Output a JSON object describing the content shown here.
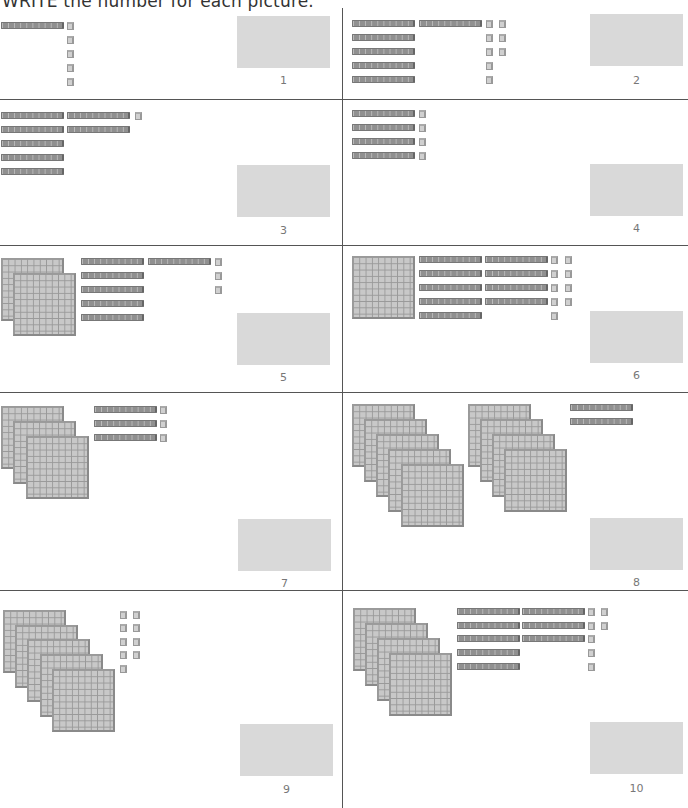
{
  "header": {
    "title": "WRITE the number for each picture."
  },
  "colors": {
    "answer_box": "#d9d9d9",
    "rod": "#909090",
    "flat": "#c8c8c8",
    "cube": "#d0d0d0",
    "divider": "#555555"
  },
  "problems": [
    {
      "number": "1",
      "hundreds": 0,
      "tens": 1,
      "ones": 5,
      "answer_value": 15
    },
    {
      "number": "2",
      "hundreds": 0,
      "tens": 6,
      "ones": 8,
      "answer_value": 68
    },
    {
      "number": "3",
      "hundreds": 0,
      "tens": 7,
      "ones": 1,
      "answer_value": 71
    },
    {
      "number": "4",
      "hundreds": 0,
      "tens": 4,
      "ones": 4,
      "answer_value": 44
    },
    {
      "number": "5",
      "hundreds": 2,
      "tens": 6,
      "ones": 3,
      "answer_value": 263
    },
    {
      "number": "6",
      "hundreds": 1,
      "tens": 9,
      "ones": 9,
      "answer_value": 199
    },
    {
      "number": "7",
      "hundreds": 3,
      "tens": 3,
      "ones": 3,
      "answer_value": 333
    },
    {
      "number": "8",
      "hundreds": 9,
      "tens": 2,
      "ones": 0,
      "answer_value": 920
    },
    {
      "number": "9",
      "hundreds": 5,
      "tens": 0,
      "ones": 9,
      "answer_value": 509
    },
    {
      "number": "10",
      "hundreds": 4,
      "tens": 8,
      "ones": 7,
      "answer_value": 487
    }
  ]
}
